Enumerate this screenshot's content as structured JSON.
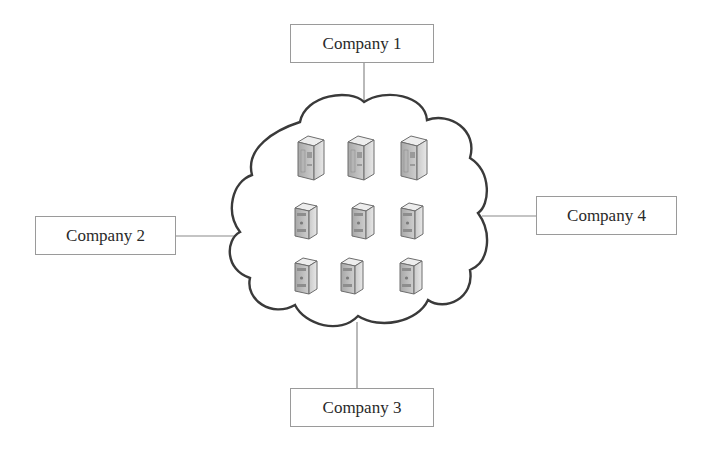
{
  "diagram": {
    "type": "network-cloud",
    "center": {
      "label": "",
      "shape": "cloud",
      "contents": "server-icons",
      "rows": [
        {
          "kind": "tower-server",
          "count": 3
        },
        {
          "kind": "desktop-server",
          "count": 3
        },
        {
          "kind": "desktop-server",
          "count": 3
        }
      ]
    },
    "nodes": [
      {
        "id": "company1",
        "label": "Company 1",
        "position": "top"
      },
      {
        "id": "company2",
        "label": "Company 2",
        "position": "left"
      },
      {
        "id": "company3",
        "label": "Company 3",
        "position": "bottom"
      },
      {
        "id": "company4",
        "label": "Company 4",
        "position": "right"
      }
    ],
    "edges": [
      {
        "from": "company1",
        "to": "cloud"
      },
      {
        "from": "company2",
        "to": "cloud"
      },
      {
        "from": "company3",
        "to": "cloud"
      },
      {
        "from": "company4",
        "to": "cloud"
      }
    ],
    "colors": {
      "line": "#8a8a8a",
      "cloud_stroke": "#3a3a3a",
      "box_border": "#9a9a9a",
      "text": "#2a2a2a"
    }
  }
}
